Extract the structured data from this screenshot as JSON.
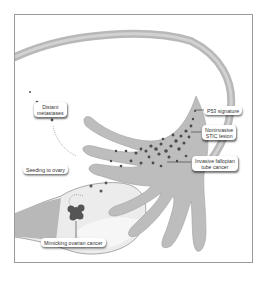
{
  "figure": {
    "labels": {
      "p53": "P53 signature",
      "stic_line1": "Noninvasive",
      "stic_line2": "STIC lesion",
      "invasive_line1": "Invasive fallopian",
      "invasive_line2": "tube cancer",
      "distant_line1": "Distant",
      "distant_line2": "metastases",
      "seeding": "Seeding to ovary",
      "mimicking": "Mimicking ovarian cancer"
    },
    "colors": {
      "tube": "#bdbdbd",
      "tube_dark": "#9e9e9e",
      "ovary": "#ececec",
      "cells": "#4a4a4a",
      "frame": "#9a9a9a"
    }
  }
}
